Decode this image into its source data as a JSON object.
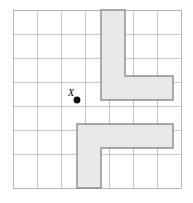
{
  "figure": {
    "background_color": "#ffffff",
    "grid": {
      "name": "square-grid",
      "origin_x": 13,
      "origin_y": 10,
      "cell_size": 24,
      "columns": 7,
      "rows": 7,
      "line_color": "#b9b9b9",
      "border_color": "#b2b2b2",
      "show_border": true
    },
    "center_point": {
      "label": "X",
      "label_dx": -9,
      "label_dy": -4,
      "cx": 77,
      "cy": 100,
      "radius": 3.4,
      "color": "#0b0b0b"
    },
    "shapes": [
      {
        "name": "upper-l-shape",
        "fill_color": "#e9e9e9",
        "stroke_color": "#8d8d8d",
        "points": "101,10 125,10 125,76 173,76 173,100 101,100"
      },
      {
        "name": "lower-l-shape",
        "fill_color": "#e9e9e9",
        "stroke_color": "#8d8d8d",
        "points": "77,124 173,124 173,148 101,148 101,188 77,188"
      }
    ]
  }
}
